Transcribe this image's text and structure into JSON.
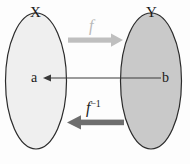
{
  "figure": {
    "sets": {
      "domain": {
        "label": "X",
        "fill": "#efefef",
        "stroke": "#2b2b2b"
      },
      "codomain": {
        "label": "Y",
        "fill": "#c9c9c9",
        "stroke": "#2b2b2b"
      }
    },
    "elements": {
      "domain_element": "a",
      "codomain_element": "b"
    },
    "arrows": {
      "forward": {
        "label": "f",
        "color": "#bfbfbf",
        "direction": "right"
      },
      "inverse": {
        "label": "f",
        "superscript": "−1",
        "color": "#6e6e6e",
        "direction": "left"
      },
      "mapping": {
        "color": "#3a3a3a",
        "direction": "left"
      }
    }
  }
}
